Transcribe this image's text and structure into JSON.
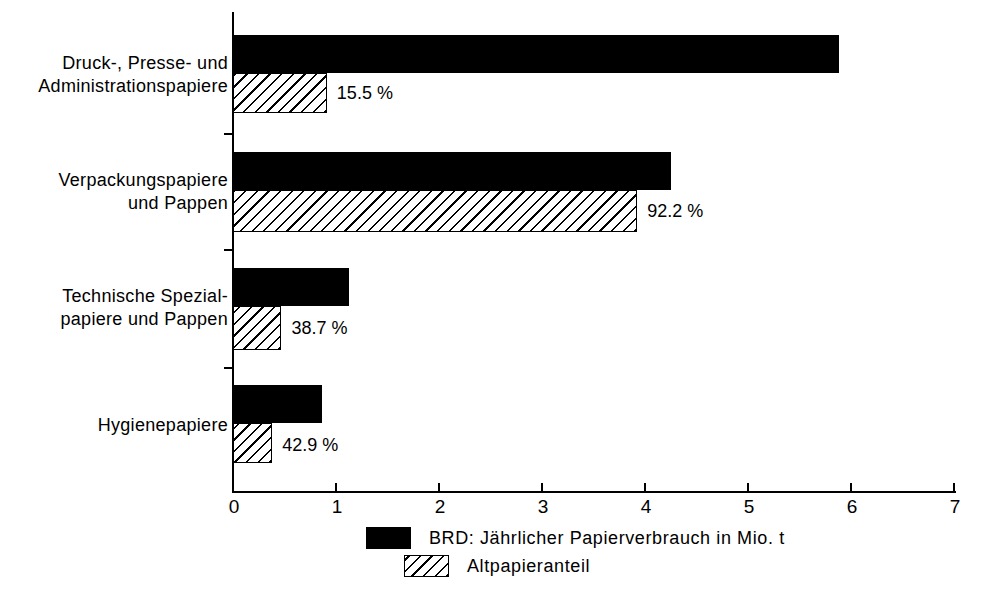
{
  "chart_data": {
    "type": "bar",
    "orientation": "horizontal",
    "title": "",
    "xlabel": "",
    "ylabel": "",
    "xlim": [
      0,
      7
    ],
    "xticks": [
      "0",
      "1",
      "2",
      "3",
      "4",
      "5",
      "6",
      "7"
    ],
    "grid": false,
    "legend_position": "bottom",
    "categories": [
      "Druck-, Presse- und\nAdministrationspapiere",
      "Verpackungspapiere\nund Pappen",
      "Technische Spezial-\npapiere und Pappen",
      "Hygienepapiere"
    ],
    "series": [
      {
        "name": "BRD: Jährlicher Papierverbrauch in Mio. t",
        "style": "solid-black",
        "values": [
          5.88,
          4.25,
          1.12,
          0.86
        ]
      },
      {
        "name": "Altpapieranteil",
        "style": "hatched",
        "values": [
          0.91,
          3.92,
          0.47,
          0.38
        ]
      }
    ],
    "annotations": [
      "15.5 %",
      "92.2 %",
      "38.7 %",
      "42.9 %"
    ],
    "units": "Mio. t"
  },
  "legend": {
    "items": [
      {
        "label": "BRD: Jährlicher Papierverbrauch in Mio. t",
        "swatch": "solid-black-swatch"
      },
      {
        "label": "Altpapieranteil",
        "swatch": "hatched-swatch"
      }
    ]
  },
  "colors": {
    "ink": "#000000",
    "paper": "#ffffff"
  }
}
